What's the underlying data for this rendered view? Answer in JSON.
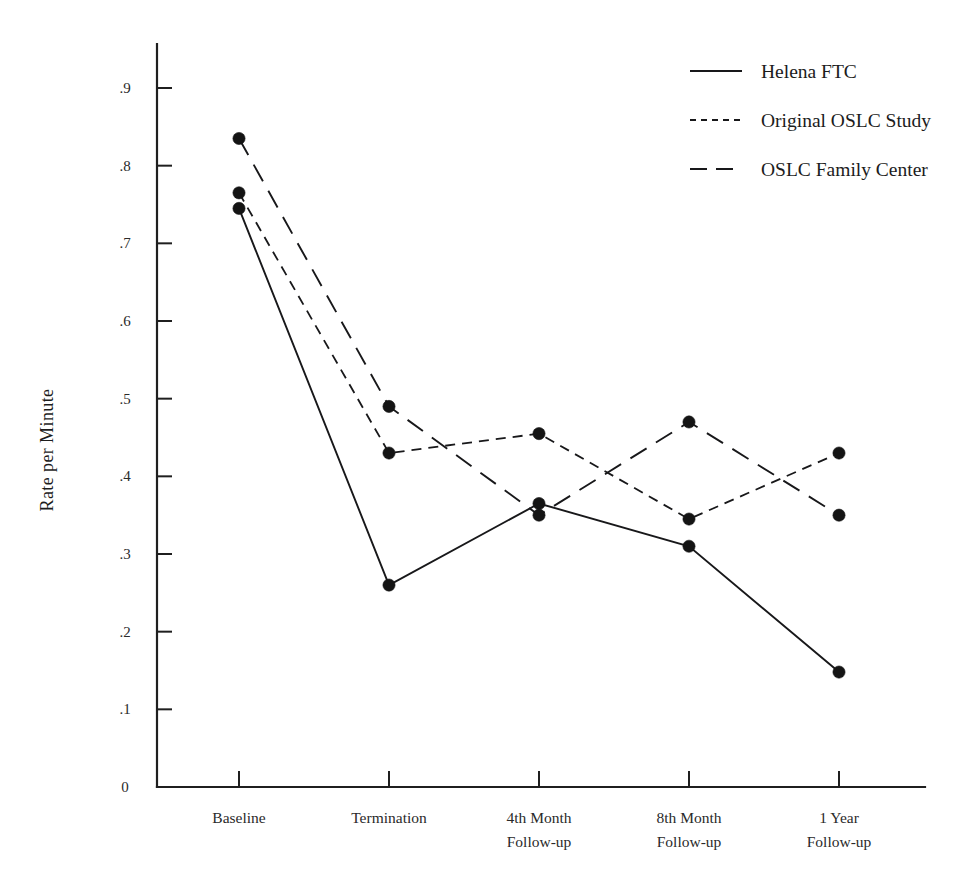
{
  "chart_data": {
    "type": "line",
    "title": "",
    "xlabel": "",
    "ylabel": "Rate per Minute",
    "ylim": [
      0,
      0.9
    ],
    "grid": false,
    "legend_position": "top-right",
    "categories": [
      "Baseline",
      "Termination",
      "4th Month\nFollow-up",
      "8th Month\nFollow-up",
      "1 Year\nFollow-up"
    ],
    "category_lines": [
      [
        "Baseline",
        ""
      ],
      [
        "Termination",
        ""
      ],
      [
        "4th Month",
        "Follow-up"
      ],
      [
        "8th Month",
        "Follow-up"
      ],
      [
        "1 Year",
        "Follow-up"
      ]
    ],
    "ytick_labels": [
      "0",
      ".1",
      ".2",
      ".3",
      ".4",
      ".5",
      ".6",
      ".7",
      ".8",
      ".9"
    ],
    "ytick_values": [
      0,
      0.1,
      0.2,
      0.3,
      0.4,
      0.5,
      0.6,
      0.7,
      0.8,
      0.9
    ],
    "series": [
      {
        "name": "Helena FTC",
        "style": "solid",
        "values": [
          0.745,
          0.26,
          0.365,
          0.31,
          0.148
        ]
      },
      {
        "name": "Original OSLC Study",
        "style": "dotted",
        "values": [
          0.765,
          0.43,
          0.455,
          0.345,
          0.43
        ]
      },
      {
        "name": "OSLC Family Center",
        "style": "dashed",
        "values": [
          0.835,
          0.49,
          0.35,
          0.47,
          0.35
        ]
      }
    ]
  },
  "legend": {
    "entries": [
      {
        "label": "Helena FTC",
        "style": "solid"
      },
      {
        "label": "Original OSLC Study",
        "style": "dotted"
      },
      {
        "label": "OSLC Family Center",
        "style": "dashed"
      }
    ]
  },
  "colors": {
    "ink": "#18181a",
    "axis": "#1f1f1f",
    "background": "#ffffff"
  }
}
